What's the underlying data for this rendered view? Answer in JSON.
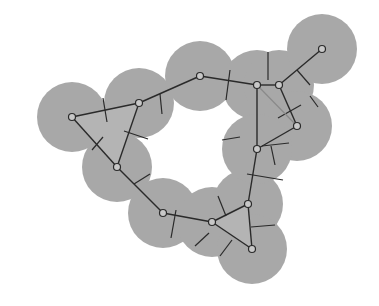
{
  "diagram": {
    "width": 379,
    "height": 306,
    "colors": {
      "background": "#ffffff",
      "disk_fill": "#a8a8a8",
      "edge": "#2a2a2a",
      "voronoi": "#2a2a2a",
      "node_fill": "#c8c8c8",
      "node_stroke": "#2a2a2a",
      "triangle_fill": "#b4b4b4",
      "faint_edge": "#8a8a8a"
    },
    "disk_radius": 35,
    "nodes": [
      {
        "id": "A",
        "x": 72,
        "y": 117
      },
      {
        "id": "B",
        "x": 139,
        "y": 103
      },
      {
        "id": "C",
        "x": 117,
        "y": 167
      },
      {
        "id": "D",
        "x": 163,
        "y": 213
      },
      {
        "id": "E",
        "x": 212,
        "y": 222
      },
      {
        "id": "F",
        "x": 248,
        "y": 204
      },
      {
        "id": "G",
        "x": 252,
        "y": 249
      },
      {
        "id": "H",
        "x": 200,
        "y": 76
      },
      {
        "id": "I",
        "x": 257,
        "y": 85
      },
      {
        "id": "J",
        "x": 279,
        "y": 85
      },
      {
        "id": "K",
        "x": 297,
        "y": 126
      },
      {
        "id": "L",
        "x": 257,
        "y": 149
      },
      {
        "id": "M",
        "x": 322,
        "y": 49
      }
    ],
    "edges": [
      [
        "A",
        "B"
      ],
      [
        "A",
        "C"
      ],
      [
        "B",
        "C"
      ],
      [
        "C",
        "D"
      ],
      [
        "D",
        "E"
      ],
      [
        "E",
        "F"
      ],
      [
        "E",
        "G"
      ],
      [
        "F",
        "G"
      ],
      [
        "F",
        "L"
      ],
      [
        "L",
        "K"
      ],
      [
        "L",
        "I"
      ],
      [
        "B",
        "H"
      ],
      [
        "H",
        "I"
      ],
      [
        "I",
        "J"
      ],
      [
        "J",
        "M"
      ],
      [
        "J",
        "K"
      ]
    ],
    "faint_edges": [
      [
        "I",
        "K"
      ]
    ],
    "voronoi_segments": [
      [
        103,
        98,
        107,
        122
      ],
      [
        92,
        150,
        103,
        137
      ],
      [
        124,
        131,
        148,
        139
      ],
      [
        160,
        94,
        162,
        114
      ],
      [
        134,
        184,
        150,
        174
      ],
      [
        171,
        238,
        176,
        210
      ],
      [
        218,
        196,
        226,
        216
      ],
      [
        195,
        246,
        209,
        233
      ],
      [
        232,
        240,
        220,
        256
      ],
      [
        251,
        227,
        275,
        225
      ],
      [
        247,
        174,
        283,
        180
      ],
      [
        240,
        137,
        222,
        140
      ],
      [
        230,
        70,
        226,
        100
      ],
      [
        268,
        52,
        268,
        80
      ],
      [
        297,
        70,
        310,
        85
      ],
      [
        310,
        96,
        318,
        107
      ],
      [
        278,
        118,
        301,
        105
      ],
      [
        262,
        146,
        289,
        143
      ],
      [
        271,
        146,
        275,
        165
      ]
    ],
    "shaded_triangles": [
      [
        [
          "A",
          0
        ],
        [
          "B",
          0
        ],
        [
          "C",
          0
        ]
      ],
      [
        [
          "E",
          0
        ],
        [
          "F",
          0
        ],
        [
          "G",
          0
        ]
      ]
    ]
  }
}
